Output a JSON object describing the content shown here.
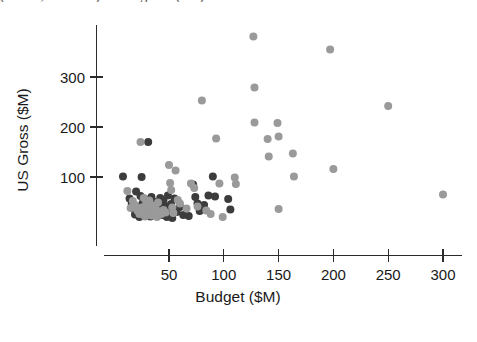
{
  "figure": {
    "caption_sliver": "(a film, a studio) and a gross (US)"
  },
  "chart_data": {
    "type": "scatter",
    "title": "",
    "xlabel": "Budget ($M)",
    "ylabel": "US Gross ($M)",
    "xlim": [
      0,
      315
    ],
    "ylim": [
      0,
      395
    ],
    "xticks": [
      50,
      100,
      150,
      200,
      250,
      300
    ],
    "yticks": [
      100,
      200,
      300
    ],
    "xtick_labels": [
      "50",
      "100",
      "150",
      "200",
      "250",
      "300"
    ],
    "ytick_labels": [
      "100",
      "200",
      "300"
    ],
    "grid": false,
    "legend": "none",
    "marker_radius_px": 4.0,
    "colors": {
      "dark": "#3c3c3c",
      "light": "#9a9a9a"
    },
    "series": [
      {
        "name": "dark",
        "color": "#3c3c3c",
        "points": [
          [
            8,
            101
          ],
          [
            14,
            57
          ],
          [
            16,
            47
          ],
          [
            18,
            36
          ],
          [
            19,
            25
          ],
          [
            20,
            71
          ],
          [
            21,
            41
          ],
          [
            22,
            30
          ],
          [
            23,
            20
          ],
          [
            24,
            62
          ],
          [
            25,
            100
          ],
          [
            26,
            48
          ],
          [
            26,
            33
          ],
          [
            27,
            23
          ],
          [
            28,
            56
          ],
          [
            29,
            42
          ],
          [
            30,
            31
          ],
          [
            31,
            170
          ],
          [
            32,
            45
          ],
          [
            33,
            21
          ],
          [
            34,
            60
          ],
          [
            35,
            37
          ],
          [
            36,
            27
          ],
          [
            37,
            50
          ],
          [
            38,
            34
          ],
          [
            39,
            22
          ],
          [
            40,
            44
          ],
          [
            41,
            29
          ],
          [
            42,
            58
          ],
          [
            43,
            38
          ],
          [
            44,
            24
          ],
          [
            45,
            52
          ],
          [
            46,
            31
          ],
          [
            47,
            41
          ],
          [
            48,
            20
          ],
          [
            49,
            63
          ],
          [
            50,
            35
          ],
          [
            51,
            26
          ],
          [
            52,
            46
          ],
          [
            53,
            18
          ],
          [
            55,
            57
          ],
          [
            57,
            30
          ],
          [
            60,
            40
          ],
          [
            63,
            24
          ],
          [
            68,
            22
          ],
          [
            72,
            85
          ],
          [
            74,
            60
          ],
          [
            76,
            47
          ],
          [
            78,
            32
          ],
          [
            82,
            44
          ],
          [
            86,
            63
          ],
          [
            90,
            101
          ],
          [
            92,
            61
          ],
          [
            104,
            56
          ],
          [
            106,
            35
          ]
        ]
      },
      {
        "name": "light",
        "color": "#9a9a9a",
        "points": [
          [
            12,
            72
          ],
          [
            15,
            38
          ],
          [
            17,
            52
          ],
          [
            19,
            44
          ],
          [
            21,
            33
          ],
          [
            23,
            26
          ],
          [
            24,
            170
          ],
          [
            25,
            39
          ],
          [
            26,
            28
          ],
          [
            27,
            58
          ],
          [
            28,
            21
          ],
          [
            29,
            46
          ],
          [
            30,
            35
          ],
          [
            31,
            25
          ],
          [
            32,
            53
          ],
          [
            33,
            30
          ],
          [
            34,
            23
          ],
          [
            35,
            43
          ],
          [
            36,
            32
          ],
          [
            37,
            27
          ],
          [
            38,
            36
          ],
          [
            39,
            20
          ],
          [
            40,
            49
          ],
          [
            41,
            31
          ],
          [
            43,
            26
          ],
          [
            45,
            34
          ],
          [
            47,
            29
          ],
          [
            50,
            124
          ],
          [
            51,
            88
          ],
          [
            52,
            74
          ],
          [
            53,
            39
          ],
          [
            54,
            28
          ],
          [
            56,
            113
          ],
          [
            58,
            54
          ],
          [
            60,
            47
          ],
          [
            66,
            37
          ],
          [
            70,
            87
          ],
          [
            73,
            78
          ],
          [
            76,
            41
          ],
          [
            80,
            253
          ],
          [
            84,
            33
          ],
          [
            88,
            26
          ],
          [
            93,
            177
          ],
          [
            96,
            87
          ],
          [
            99,
            20
          ],
          [
            110,
            99
          ],
          [
            111,
            86
          ],
          [
            127,
            381
          ],
          [
            128,
            279
          ],
          [
            128,
            209
          ],
          [
            140,
            176
          ],
          [
            141,
            141
          ],
          [
            149,
            208
          ],
          [
            150,
            181
          ],
          [
            150,
            36
          ],
          [
            163,
            147
          ],
          [
            164,
            101
          ],
          [
            197,
            355
          ],
          [
            200,
            116
          ],
          [
            250,
            242
          ],
          [
            300,
            65
          ]
        ]
      }
    ]
  }
}
